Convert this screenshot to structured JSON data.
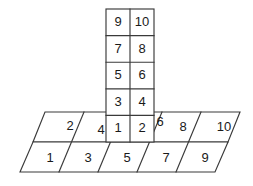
{
  "diagram": {
    "ink_color": "#3a3a3a",
    "text_color": "#1a1a1a",
    "fill_color": "#ffffff",
    "tower": {
      "name": "vertical-numbered-column",
      "columns": 2,
      "rows": 5,
      "left": 106,
      "right": 154,
      "top": 9,
      "bottom": 142,
      "cells": [
        {
          "label": "9",
          "col": 0,
          "row": 0
        },
        {
          "label": "10",
          "col": 1,
          "row": 0
        },
        {
          "label": "7",
          "col": 0,
          "row": 1
        },
        {
          "label": "8",
          "col": 1,
          "row": 1
        },
        {
          "label": "5",
          "col": 0,
          "row": 2
        },
        {
          "label": "6",
          "col": 1,
          "row": 2
        },
        {
          "label": "3",
          "col": 0,
          "row": 3
        },
        {
          "label": "4",
          "col": 1,
          "row": 3
        },
        {
          "label": "1",
          "col": 0,
          "row": 4
        },
        {
          "label": "2",
          "col": 1,
          "row": 4
        }
      ]
    },
    "base": {
      "name": "slanted-parallelogram-base",
      "top_left_x": 45,
      "top_right_x": 240,
      "top_y": 112,
      "bottom_left_x": 20,
      "bottom_right_x": 215,
      "bottom_y": 172,
      "mid_y": 142,
      "columns": 5,
      "back_row": [
        {
          "label": "2",
          "index": 0
        },
        {
          "label": "4",
          "index": 1
        },
        {
          "label": "6",
          "index": 2
        },
        {
          "label": "8",
          "index": 3
        },
        {
          "label": "10",
          "index": 4
        }
      ],
      "front_row": [
        {
          "label": "1",
          "index": 0
        },
        {
          "label": "3",
          "index": 1
        },
        {
          "label": "5",
          "index": 2
        },
        {
          "label": "7",
          "index": 3
        },
        {
          "label": "9",
          "index": 4
        }
      ]
    }
  }
}
